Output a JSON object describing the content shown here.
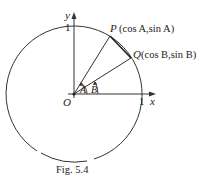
{
  "figure": {
    "caption": "Fig. 5.4",
    "axes": {
      "x_label": "x",
      "y_label": "y",
      "origin_label": "O",
      "x_tick": "1",
      "y_tick": "1"
    },
    "points": {
      "P": {
        "name": "P",
        "coords": "(cos A,sin A)"
      },
      "Q": {
        "name": "Q",
        "coords": "(cos B,sin B)"
      }
    },
    "angles": {
      "A": "A",
      "B": "B"
    }
  },
  "colors": {
    "ink": "#222222",
    "background": "#ffffff"
  }
}
